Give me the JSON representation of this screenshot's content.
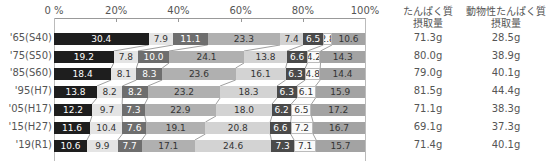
{
  "chart_data": {
    "type": "bar",
    "orientation": "horizontal",
    "stacked": true,
    "percent": true,
    "title": "",
    "xlabel": "",
    "ylabel": "",
    "xlim": [
      0,
      100
    ],
    "x_ticks": [
      "0 %",
      "20%",
      "40%",
      "60%",
      "80%",
      "100%"
    ],
    "grid": false,
    "legend": "none",
    "categories": [
      "'65(S40)",
      "'75(S50)",
      "'85(S60)",
      "'95(H7)",
      "'05(H17)",
      "'15(H27)",
      "'19(R1)"
    ],
    "series": [
      {
        "name": "segment-1",
        "color": "#1e1e1e",
        "values": [
          30.4,
          19.2,
          18.4,
          13.8,
          12.2,
          11.6,
          10.6
        ]
      },
      {
        "name": "segment-2",
        "color": "#e4e4e4",
        "values": [
          7.9,
          7.8,
          8.1,
          8.2,
          9.7,
          10.4,
          9.9
        ]
      },
      {
        "name": "segment-3",
        "color": "#6e6e6e",
        "values": [
          11.1,
          10.0,
          8.3,
          8.2,
          7.3,
          7.6,
          7.7
        ]
      },
      {
        "name": "segment-4",
        "color": "#b0b0b0",
        "values": [
          23.3,
          24.1,
          23.6,
          23.2,
          22.9,
          19.1,
          17.1
        ]
      },
      {
        "name": "segment-5",
        "color": "#d3d3d3",
        "values": [
          7.4,
          13.8,
          16.1,
          18.3,
          18.0,
          20.8,
          24.6
        ]
      },
      {
        "name": "segment-6",
        "color": "#4a4a4a",
        "values": [
          6.5,
          6.6,
          6.3,
          6.3,
          6.2,
          6.6,
          7.3
        ]
      },
      {
        "name": "segment-7",
        "color": "#fafafa",
        "values": [
          2.8,
          4.2,
          4.8,
          6.1,
          6.5,
          7.2,
          7.1
        ]
      },
      {
        "name": "segment-8",
        "color": "#a3a3a3",
        "values": [
          10.6,
          14.3,
          14.4,
          15.9,
          17.2,
          16.7,
          15.7
        ]
      }
    ],
    "side_table": {
      "headers": [
        [
          "たんぱく質",
          "摂取量"
        ],
        [
          "動物性たんぱく質",
          "摂取量"
        ]
      ],
      "protein_intake": [
        "71.3g",
        "80.0g",
        "79.0g",
        "81.5g",
        "71.1g",
        "69.1g",
        "71.4g"
      ],
      "animal_protein_intake": [
        "28.5g",
        "38.9g",
        "40.1g",
        "44.4g",
        "38.3g",
        "37.3g",
        "40.1g"
      ]
    }
  },
  "axis": {
    "ticks": [
      {
        "label": "0 %",
        "pct": 0
      },
      {
        "label": "20%",
        "pct": 20
      },
      {
        "label": "40%",
        "pct": 40
      },
      {
        "label": "60%",
        "pct": 60
      },
      {
        "label": "80%",
        "pct": 80
      },
      {
        "label": "100%",
        "pct": 100
      }
    ]
  },
  "columns": {
    "protein": {
      "line1": "たんぱく質",
      "line2": "摂取量"
    },
    "animal_protein": {
      "line1": "動物性たんぱく質",
      "line2": "摂取量"
    }
  }
}
